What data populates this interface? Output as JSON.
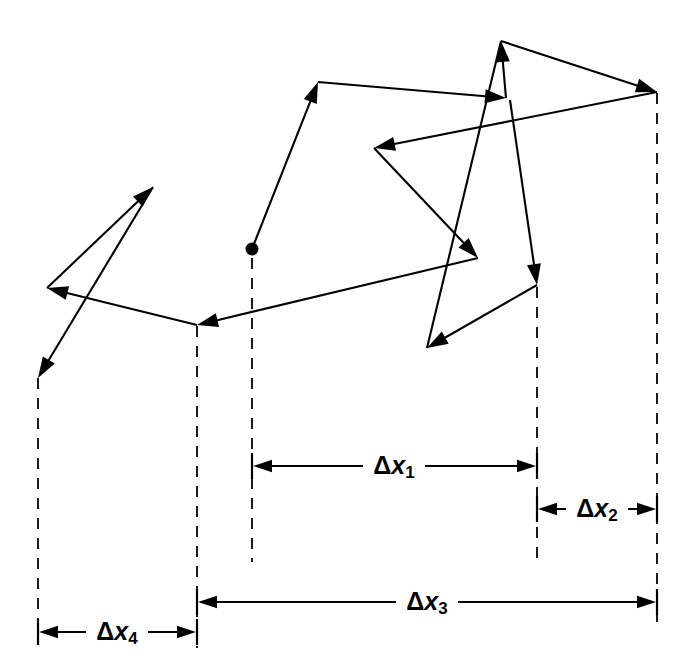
{
  "figure": {
    "kind": "random-walk-displacement-diagram",
    "background_color": "#ffffff",
    "ink_color": "#000000",
    "width": 697,
    "height": 670,
    "start_marker": {
      "name": "start-point",
      "shape": "filled-circle",
      "x": 252,
      "y": 249,
      "radius": 6.5
    }
  },
  "labels": {
    "delta_x1": {
      "delta": "Δ",
      "var": "x",
      "sub": "1",
      "text": "Δx₁"
    },
    "delta_x2": {
      "delta": "Δ",
      "var": "x",
      "sub": "2",
      "text": "Δx₂"
    },
    "delta_x3": {
      "delta": "Δ",
      "var": "x",
      "sub": "3",
      "text": "Δx₃"
    },
    "delta_x4": {
      "delta": "Δ",
      "var": "x",
      "sub": "4",
      "text": "Δx₄"
    }
  },
  "guide_lines": [
    {
      "name": "guide-line-leftmost",
      "x": 38,
      "y1": 378,
      "y2": 632
    },
    {
      "name": "guide-line-left",
      "x": 197,
      "y1": 326,
      "y2": 648
    },
    {
      "name": "guide-line-start",
      "x": 252,
      "y1": 258,
      "y2": 562
    },
    {
      "name": "guide-line-right",
      "x": 537,
      "y1": 287,
      "y2": 562
    },
    {
      "name": "guide-line-rightmost",
      "x": 657,
      "y1": 93,
      "y2": 622
    }
  ],
  "dimensions": [
    {
      "name": "dimension-delta-x1",
      "label_key": "delta_x1",
      "x_from": 252,
      "x_to": 537,
      "y": 466,
      "label_x": 394,
      "label_y": 466,
      "arrows": "both"
    },
    {
      "name": "dimension-delta-x2",
      "label_key": "delta_x2",
      "x_from": 537,
      "x_to": 657,
      "y": 509,
      "label_x": 597,
      "label_y": 509,
      "arrows": "both"
    },
    {
      "name": "dimension-delta-x3",
      "label_key": "delta_x3",
      "x_from": 197,
      "x_to": 657,
      "y": 602,
      "label_x": 427,
      "label_y": 602,
      "arrows": "both"
    },
    {
      "name": "dimension-delta-x4",
      "label_key": "delta_x4",
      "x_from": 38,
      "x_to": 197,
      "y": 632,
      "label_x": 117,
      "label_y": 632,
      "arrows": "both"
    }
  ],
  "walk_segments": [
    {
      "name": "walk-segment-1",
      "from": [
        252,
        249
      ],
      "to": [
        318,
        82
      ],
      "arrowhead": true
    },
    {
      "name": "walk-segment-2",
      "from": [
        318,
        82
      ],
      "to": [
        506,
        98
      ],
      "arrowhead": true
    },
    {
      "name": "walk-segment-3",
      "from": [
        506,
        98
      ],
      "to": [
        501,
        41
      ],
      "arrowhead": true
    },
    {
      "name": "walk-segment-4",
      "from": [
        501,
        41
      ],
      "to": [
        657,
        92
      ],
      "arrowhead": true
    },
    {
      "name": "walk-segment-5",
      "from": [
        657,
        92
      ],
      "to": [
        374,
        148
      ],
      "arrowhead": true
    },
    {
      "name": "walk-segment-6",
      "from": [
        374,
        148
      ],
      "to": [
        478,
        258
      ],
      "arrowhead": true
    },
    {
      "name": "walk-segment-7",
      "from": [
        478,
        258
      ],
      "to": [
        197,
        325
      ],
      "arrowhead": true
    },
    {
      "name": "walk-segment-8",
      "from": [
        197,
        325
      ],
      "to": [
        47,
        288
      ],
      "arrowhead": true
    },
    {
      "name": "walk-segment-9",
      "from": [
        47,
        288
      ],
      "to": [
        153,
        187
      ],
      "arrowhead": true
    },
    {
      "name": "walk-segment-10",
      "from": [
        153,
        187
      ],
      "to": [
        38,
        378
      ],
      "arrowhead": true
    },
    {
      "name": "walk-segment-11",
      "from": [
        510,
        100
      ],
      "to": [
        537,
        285
      ],
      "arrowhead": true
    },
    {
      "name": "walk-segment-12",
      "from": [
        537,
        285
      ],
      "to": [
        427,
        348
      ],
      "arrowhead": true
    },
    {
      "name": "walk-segment-13",
      "from": [
        427,
        348
      ],
      "to": [
        501,
        41
      ],
      "arrowhead": false
    }
  ],
  "chart_data": {
    "type": "diagram",
    "title": "",
    "start_point": [
      252,
      249
    ],
    "vertices": [
      [
        252,
        249
      ],
      [
        318,
        82
      ],
      [
        506,
        98
      ],
      [
        501,
        41
      ],
      [
        657,
        92
      ],
      [
        374,
        148
      ],
      [
        478,
        258
      ],
      [
        197,
        325
      ],
      [
        47,
        288
      ],
      [
        153,
        187
      ],
      [
        38,
        378
      ],
      [
        537,
        285
      ],
      [
        427,
        348
      ]
    ],
    "displacements": [
      {
        "label": "Δx₁",
        "x_from": 252,
        "x_to": 537,
        "span": 285
      },
      {
        "label": "Δx₂",
        "x_from": 537,
        "x_to": 657,
        "span": 120
      },
      {
        "label": "Δx₃",
        "x_from": 197,
        "x_to": 657,
        "span": 460
      },
      {
        "label": "Δx₄",
        "x_from": 38,
        "x_to": 197,
        "span": 159
      }
    ],
    "xlabel": "",
    "ylabel": "",
    "grid": false,
    "legend": false
  }
}
